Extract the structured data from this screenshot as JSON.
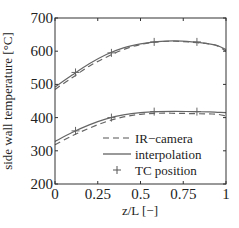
{
  "chart_data": {
    "type": "line",
    "title": "",
    "xlabel": "z/L [−]",
    "ylabel": "side wall temperature [°C]",
    "xlim": [
      0,
      1
    ],
    "ylim": [
      200,
      700
    ],
    "xticks": [
      0,
      0.25,
      0.5,
      0.75,
      1
    ],
    "xtick_labels": [
      "0",
      "0.25",
      "0.5",
      "0.75",
      "1"
    ],
    "yticks": [
      200,
      300,
      400,
      500,
      600,
      700
    ],
    "ytick_labels": [
      "200",
      "300",
      "400",
      "500",
      "600",
      "700"
    ],
    "grid": false,
    "legend_position": "lower right",
    "legend": [
      {
        "label": "IR−camera",
        "style": "dashed"
      },
      {
        "label": "interpolation",
        "style": "solid"
      },
      {
        "label": "TC position",
        "style": "plus-marker"
      }
    ],
    "colors": {
      "line": "#666666",
      "axis": "#333333"
    },
    "series": [
      {
        "name": "IR−camera (upper)",
        "style": "dashed",
        "x": [
          0,
          0.1,
          0.2,
          0.3,
          0.4,
          0.5,
          0.6,
          0.7,
          0.8,
          0.9,
          0.95,
          1.0
        ],
        "y": [
          485,
          520,
          555,
          582,
          605,
          620,
          628,
          630,
          627,
          622,
          616,
          600
        ]
      },
      {
        "name": "interpolation (upper)",
        "style": "solid",
        "x": [
          0,
          0.1,
          0.2,
          0.3,
          0.4,
          0.5,
          0.6,
          0.7,
          0.8,
          0.9,
          0.95,
          1.0
        ],
        "y": [
          492,
          528,
          562,
          590,
          610,
          622,
          629,
          631,
          628,
          622,
          617,
          605
        ]
      },
      {
        "name": "TC position (upper)",
        "style": "plus",
        "x": [
          0.12,
          0.33,
          0.58,
          0.83
        ],
        "y": [
          536,
          595,
          628,
          628
        ]
      },
      {
        "name": "IR−camera (lower)",
        "style": "dashed",
        "x": [
          0,
          0.1,
          0.2,
          0.3,
          0.4,
          0.5,
          0.6,
          0.7,
          0.8,
          0.9,
          0.95,
          1.0
        ],
        "y": [
          318,
          345,
          368,
          388,
          402,
          410,
          413,
          413,
          412,
          411,
          410,
          405
        ]
      },
      {
        "name": "interpolation (lower)",
        "style": "solid",
        "x": [
          0,
          0.1,
          0.2,
          0.3,
          0.4,
          0.5,
          0.6,
          0.7,
          0.8,
          0.9,
          0.95,
          1.0
        ],
        "y": [
          328,
          355,
          378,
          396,
          408,
          415,
          418,
          419,
          418,
          417,
          416,
          415
        ]
      },
      {
        "name": "TC position (lower)",
        "style": "plus",
        "x": [
          0.12,
          0.33,
          0.58,
          0.83
        ],
        "y": [
          360,
          400,
          418,
          418
        ]
      }
    ]
  }
}
